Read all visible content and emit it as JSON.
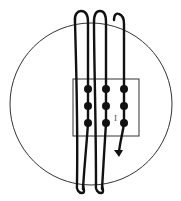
{
  "diagram": {
    "circle": {
      "cx": 91,
      "cy": 104,
      "r": 81,
      "stroke": "#333333"
    },
    "rectangle": {
      "x": 73,
      "y": 79,
      "width": 66,
      "height": 57,
      "stroke": "#333333"
    },
    "dots": [
      {
        "cx": 88,
        "cy": 89
      },
      {
        "cx": 106,
        "cy": 89
      },
      {
        "cx": 124,
        "cy": 89
      },
      {
        "cx": 88,
        "cy": 107
      },
      {
        "cx": 106,
        "cy": 107
      },
      {
        "cx": 124,
        "cy": 107
      },
      {
        "cx": 88,
        "cy": 123
      },
      {
        "cx": 106,
        "cy": 123
      },
      {
        "cx": 124,
        "cy": 123
      }
    ],
    "current_label": "I",
    "wire_color": "#111111",
    "arrow_direction": "down"
  }
}
